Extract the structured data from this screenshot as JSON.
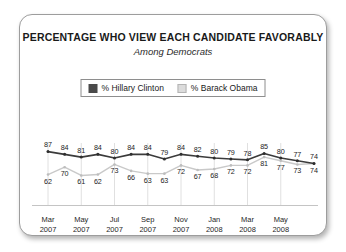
{
  "card": {
    "title": "PERCENTAGE WHO VIEW EACH CANDIDATE FAVORABLY",
    "subtitle": "Among Democrats"
  },
  "legend": {
    "entries": [
      {
        "label": "% Hillary Clinton",
        "color": "#4a4a4a",
        "swatch": "clinton"
      },
      {
        "label": "% Barack Obama",
        "color": "#dcdcdc",
        "swatch": "obama"
      }
    ]
  },
  "chart_data": {
    "type": "line",
    "title": "PERCENTAGE WHO VIEW EACH CANDIDATE FAVORABLY",
    "subtitle": "Among Democrats",
    "xlabel": "",
    "ylabel": "",
    "ylim": [
      55,
      92
    ],
    "grid": true,
    "legend_position": "top-center",
    "x": [
      "Mar 2007",
      "Apr 2007",
      "May 2007",
      "Jun 2007",
      "Jul 2007",
      "Aug 2007",
      "Sep 2007",
      "Oct 2007",
      "Nov 2007",
      "Dec 2007",
      "Jan 2008",
      "Feb 2008",
      "Mar 2008",
      "Apr 2008",
      "May 2008",
      "Jun 2008",
      "Jul 2008"
    ],
    "tick_labels": [
      {
        "index": 0,
        "month": "Mar",
        "year": "2007"
      },
      {
        "index": 2,
        "month": "May",
        "year": "2007"
      },
      {
        "index": 4,
        "month": "Jul",
        "year": "2007"
      },
      {
        "index": 6,
        "month": "Sep",
        "year": "2007"
      },
      {
        "index": 8,
        "month": "Nov",
        "year": "2007"
      },
      {
        "index": 10,
        "month": "Jan",
        "year": "2008"
      },
      {
        "index": 12,
        "month": "Mar",
        "year": "2008"
      },
      {
        "index": 14,
        "month": "May",
        "year": "2008"
      }
    ],
    "series": [
      {
        "name": "% Hillary Clinton",
        "color": "#3b3b3b",
        "values": [
          87,
          84,
          81,
          84,
          80,
          84,
          84,
          79,
          84,
          82,
          80,
          79,
          78,
          85,
          80,
          77,
          74
        ]
      },
      {
        "name": "% Barack Obama",
        "color": "#c9c9c9",
        "values": [
          62,
          70,
          61,
          62,
          73,
          66,
          63,
          63,
          72,
          67,
          68,
          72,
          72,
          81,
          77,
          73,
          74
        ]
      }
    ]
  }
}
